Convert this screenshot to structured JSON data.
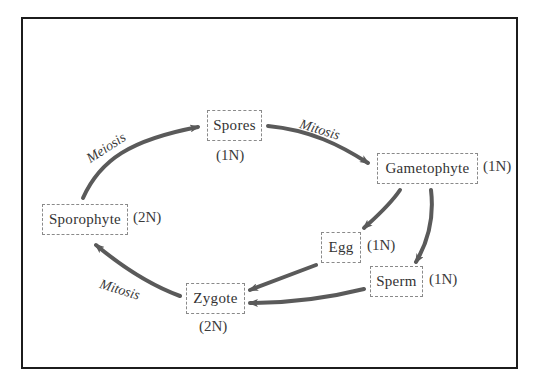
{
  "diagram": {
    "arrow_color": "#5a5a5a",
    "frame_color": "#1c1c1c",
    "nodes": {
      "spores": {
        "label": "Spores",
        "ploidy": "(1N)"
      },
      "gametophyte": {
        "label": "Gametophyte",
        "ploidy": "(1N)"
      },
      "egg": {
        "label": "Egg",
        "ploidy": "(1N)"
      },
      "sperm": {
        "label": "Sperm",
        "ploidy": "(1N)"
      },
      "zygote": {
        "label": "Zygote",
        "ploidy": "(2N)"
      },
      "sporophyte": {
        "label": "Sporophyte",
        "ploidy": "(2N)"
      }
    },
    "processes": {
      "meiosis": "Meiosis",
      "mitosis_spores_to_gametophyte": "Mitosis",
      "mitosis_zygote_to_sporophyte": "Mitosis"
    },
    "edges": [
      {
        "from": "sporophyte",
        "to": "spores",
        "label": "Meiosis"
      },
      {
        "from": "spores",
        "to": "gametophyte",
        "label": "Mitosis"
      },
      {
        "from": "gametophyte",
        "to": "egg",
        "label": ""
      },
      {
        "from": "gametophyte",
        "to": "sperm",
        "label": ""
      },
      {
        "from": "egg",
        "to": "zygote",
        "label": ""
      },
      {
        "from": "sperm",
        "to": "zygote",
        "label": ""
      },
      {
        "from": "zygote",
        "to": "sporophyte",
        "label": "Mitosis"
      }
    ]
  }
}
